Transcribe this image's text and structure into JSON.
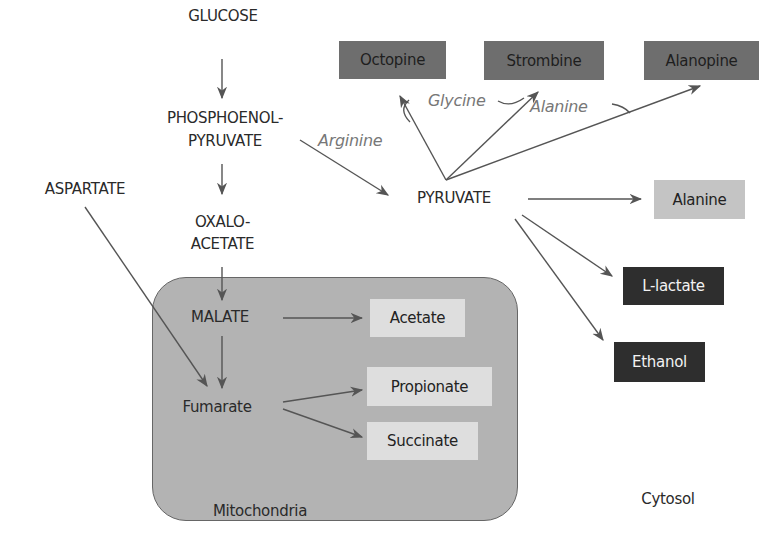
{
  "diagram": {
    "compartments": {
      "mitochondria": "Mitochondria",
      "cytosol": "Cytosol"
    },
    "metabolites": {
      "glucose": "GLUCOSE",
      "pep_line1": "PHOSPHOENOL-",
      "pep_line2": "PYRUVATE",
      "aspartate": "ASPARTATE",
      "oxalo_line1": "OXALO-",
      "oxalo_line2": "ACETATE",
      "pyruvate": "PYRUVATE",
      "malate": "MALATE",
      "fumarate": "Fumarate"
    },
    "end_products": {
      "octopine": "Octopine",
      "strombine": "Strombine",
      "alanopine": "Alanopine",
      "alanine": "Alanine",
      "l_lactate": "L-lactate",
      "ethanol": "Ethanol",
      "acetate": "Acetate",
      "propionate": "Propionate",
      "succinate": "Succinate"
    },
    "cosubstrates": {
      "arginine": "Arginine",
      "glycine": "Glycine",
      "alanine": "Alanine"
    },
    "colors": {
      "opine_box": "#6e6e6e",
      "dark_box": "#2e2e2e",
      "alanine_box": "#c4c4c4",
      "mito_product_box": "#dedede",
      "mitochondria_fill": "#b3b3b3",
      "arrow": "#555555",
      "cosubstrate_text": "#777777"
    }
  }
}
